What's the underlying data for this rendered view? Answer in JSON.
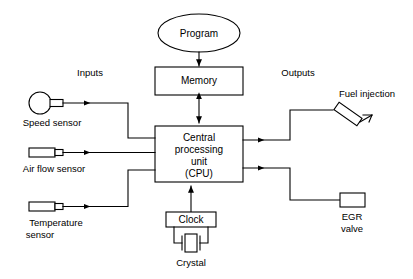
{
  "diagram": {
    "blocks": {
      "program": {
        "label": "Program",
        "shape": "ellipse"
      },
      "memory": {
        "label": "Memory",
        "shape": "rectangle"
      },
      "cpu": {
        "label_line1": "Central",
        "label_line2": "processing",
        "label_line3": "unit",
        "label_line4": "(CPU)",
        "shape": "rectangle"
      },
      "clock": {
        "label": "Clock",
        "shape": "rectangle"
      },
      "crystal": {
        "label": "Crystal",
        "shape": "crystal-symbol"
      }
    },
    "section_labels": {
      "inputs": "Inputs",
      "outputs": "Outputs"
    },
    "inputs": [
      {
        "label": "Speed sensor",
        "icon": "speed-sensor-icon"
      },
      {
        "label": "Air flow sensor",
        "icon": "air-flow-sensor-icon"
      },
      {
        "label_line1": "Temperature",
        "label_line2": "sensor",
        "icon": "temperature-sensor-icon"
      }
    ],
    "outputs": [
      {
        "label": "Fuel injection",
        "icon": "fuel-injector-icon"
      },
      {
        "label_line1": "EGR",
        "label_line2": "valve",
        "icon": "egr-valve-icon"
      }
    ],
    "colors": {
      "background": "#ffffff",
      "stroke": "#000000",
      "fill": "#ffffff",
      "text": "#000000"
    }
  }
}
